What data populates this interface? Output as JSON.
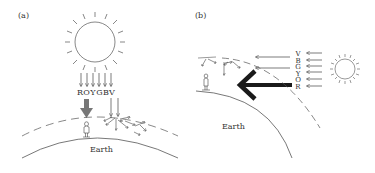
{
  "panels": [
    {
      "label": "(a)",
      "earth_label": "Earth",
      "spectrum_letters": [
        "R",
        "O",
        "Y",
        "G",
        "B",
        "V"
      ],
      "description": "Sun overhead; light passes through short atmosphere path; blue/violet scattered"
    },
    {
      "label": "(b)",
      "earth_label": "Earth",
      "spectrum_letters": [
        "V",
        "B",
        "G",
        "Y",
        "O",
        "R"
      ],
      "description": "Sun near horizon; long atmosphere path; mostly red reaches observer"
    }
  ],
  "colors": {
    "line": "#444444",
    "thick_arrow_a": "#777777",
    "thick_arrow_b": "#1a1a1a"
  }
}
